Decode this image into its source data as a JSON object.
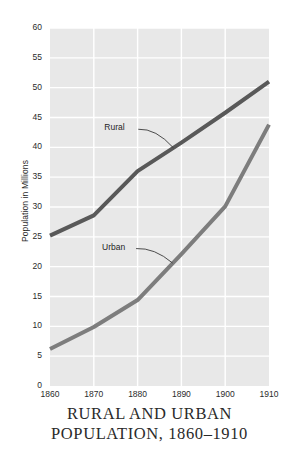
{
  "chart_data": {
    "type": "line",
    "title": "RURAL AND URBAN POPULATION, 1860–1910",
    "title_lines": [
      "RURAL AND URBAN",
      "POPULATION, 1860–1910"
    ],
    "xlabel": "",
    "ylabel": "Population in Millions",
    "xlim": [
      1860,
      1910
    ],
    "ylim": [
      0,
      60
    ],
    "x": [
      1860,
      1870,
      1880,
      1890,
      1900,
      1910
    ],
    "xticks": [
      "1860",
      "1870",
      "1880",
      "1890",
      "1900",
      "1910"
    ],
    "yticks": [
      "0",
      "5",
      "10",
      "15",
      "20",
      "25",
      "30",
      "35",
      "40",
      "45",
      "50",
      "55",
      "60"
    ],
    "ytick_values": [
      0,
      5,
      10,
      15,
      20,
      25,
      30,
      35,
      40,
      45,
      50,
      55,
      60
    ],
    "grid": true,
    "grid_color": "#ffffff",
    "plot_background": "#e8e8e8",
    "legend_position": "inline-annotations",
    "series": [
      {
        "name": "Rural",
        "color": "#595959",
        "line_width": 4,
        "values": [
          25.2,
          28.6,
          36.0,
          40.8,
          45.8,
          51.0
        ],
        "label_text": "Rural",
        "label_x": 1876.5,
        "label_y": 43.2
      },
      {
        "name": "Urban",
        "color": "#7d7d7d",
        "line_width": 4,
        "values": [
          6.2,
          9.9,
          14.4,
          22.1,
          30.1,
          43.8
        ],
        "label_text": "Urban",
        "label_x": 1876.0,
        "label_y": 23.2
      }
    ]
  }
}
